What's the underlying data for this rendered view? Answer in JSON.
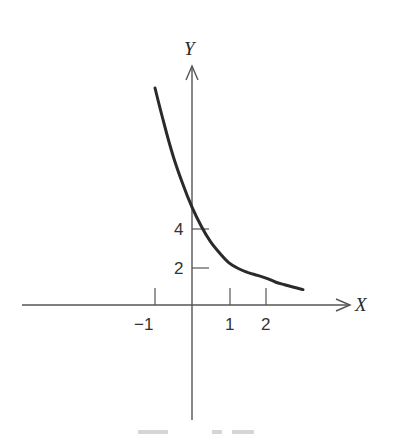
{
  "chart_data": {
    "type": "line",
    "title": "",
    "xlabel": "X",
    "ylabel": "Y",
    "x_ticks": [
      {
        "value": -1,
        "label": "−1"
      },
      {
        "value": 1,
        "label": "1"
      },
      {
        "value": 2,
        "label": "2"
      }
    ],
    "y_ticks": [
      {
        "value": 2,
        "label": "2"
      },
      {
        "value": 4,
        "label": "4"
      }
    ],
    "xlim": [
      -4.6,
      4.2
    ],
    "ylim": [
      -6,
      12.5
    ],
    "grid": false,
    "legend": null,
    "series": [
      {
        "name": "exponential decay curve",
        "x": [
          -1.0,
          -0.75,
          -0.5,
          -0.25,
          0.0,
          0.25,
          0.5,
          0.75,
          1.0,
          1.25,
          1.5,
          1.75,
          2.0,
          2.25,
          2.5,
          2.75,
          3.0
        ],
        "y": [
          11.3,
          9.4,
          7.7,
          6.3,
          5.1,
          4.1,
          3.3,
          2.7,
          2.2,
          1.9,
          1.7,
          1.55,
          1.4,
          1.2,
          1.05,
          0.92,
          0.8
        ]
      }
    ]
  },
  "figure": {
    "origin_px": [
      192,
      305
    ],
    "x_unit_px": 37,
    "y_unit_px": 19.2,
    "x_axis_px": [
      22,
      350
    ],
    "y_axis_px": [
      66,
      420
    ]
  }
}
